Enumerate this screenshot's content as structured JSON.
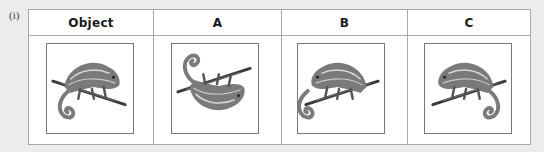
{
  "question_label": "(i)",
  "table": {
    "headers": [
      "Object",
      "A",
      "B",
      "C"
    ],
    "cells": [
      {
        "image": "chameleon-icon",
        "orientation": "original",
        "description": "Chameleon on branch, facing right, tail curled below-left"
      },
      {
        "image": "chameleon-icon",
        "orientation": "flipped-vertical",
        "description": "Chameleon upside down, tail curled upper-right"
      },
      {
        "image": "chameleon-icon",
        "orientation": "rotated-180-mirrored",
        "description": "Chameleon facing left, tail curled below-right"
      },
      {
        "image": "chameleon-icon",
        "orientation": "mirrored-horizontal",
        "description": "Chameleon facing left, tail curled below-left"
      }
    ]
  },
  "colors": {
    "background": "#ececec",
    "table_border": "#a9a9a9",
    "chameleon_body": "#7a7a7a",
    "chameleon_stripe": "#d8d8d8",
    "branch": "#3a3a3a"
  }
}
